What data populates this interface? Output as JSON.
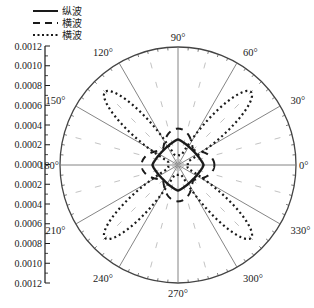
{
  "chart_data": {
    "type": "polar-line",
    "title": "",
    "radial_axis": {
      "ticks": [
        "0.0012",
        "0.0010",
        "0.0008",
        "0.0006",
        "0.0004",
        "0.0002",
        "0.0000",
        "0.0002",
        "0.0004",
        "0.0006",
        "0.0008",
        "0.0010",
        "0.0012"
      ],
      "rmax": 0.0012,
      "tick_step": 0.0002
    },
    "angular_axis": {
      "unit": "degree",
      "labels": [
        "0°",
        "30°",
        "60°",
        "90°",
        "120°",
        "150°",
        "180°",
        "210°",
        "240°",
        "270°",
        "300°",
        "330°"
      ],
      "angles": [
        0,
        30,
        60,
        90,
        120,
        150,
        180,
        210,
        240,
        270,
        300,
        330
      ]
    },
    "grid": true,
    "legend": {
      "position": "top-left"
    },
    "series": [
      {
        "name": "纵波",
        "style": "solid",
        "shape": "rounded-diamond",
        "r_at_0_90_180_270": 0.00026,
        "r_at_45": 0.00019
      },
      {
        "name": "横波",
        "style": "dashed",
        "shape": "four-lobe-axial",
        "r_at_0_90_180_270": 0.00037,
        "r_at_45": 0.00022
      },
      {
        "name": "横波",
        "style": "dotted",
        "shape": "four-petal-diagonal",
        "r_at_45_135_225_315": 0.00105,
        "r_at_0_90_180_270": 0.0001
      }
    ]
  },
  "legend": {
    "items": [
      {
        "label": "纵波",
        "style": "solid"
      },
      {
        "label": "横波",
        "style": "dashed"
      },
      {
        "label": "横波",
        "style": "dotted"
      }
    ]
  },
  "colors": {
    "line": "#1a1a1a",
    "grid": "#777777",
    "inner_grid": "#bbbbbb"
  }
}
